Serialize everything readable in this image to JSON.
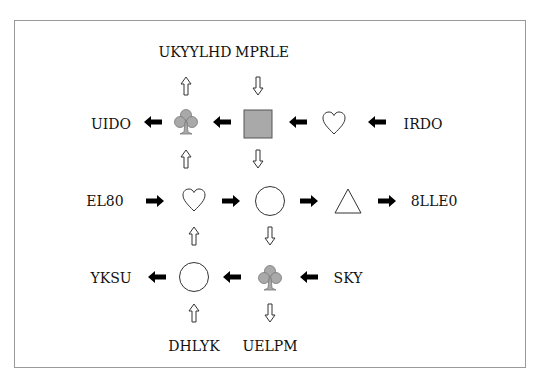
{
  "diagram": {
    "type": "symbol-flow-puzzle",
    "labels": {
      "top_left": "UKYYLHD",
      "top_right": "MPRLE",
      "row1_left": "UIDO",
      "row1_right": "IRDO",
      "row2_left": "EL80",
      "row2_right": "8LLE0",
      "row3_left": "YKSU",
      "row3_right": "SKY",
      "bottom_left": "DHLYK",
      "bottom_right": "UELPM"
    },
    "grid": [
      [
        "club",
        "square",
        "heart"
      ],
      [
        "heart",
        "circle",
        "triangle"
      ],
      [
        "circle",
        "club"
      ]
    ],
    "colors": {
      "shape_fill_gray": "#a9a9a9",
      "arrow_solid": "#000000",
      "frame_border": "#999999"
    }
  }
}
